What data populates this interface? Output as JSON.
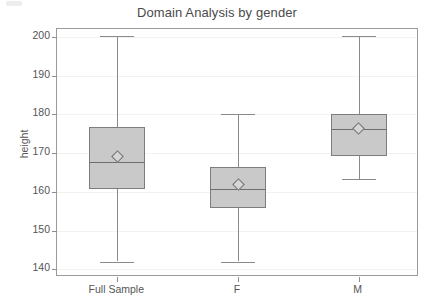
{
  "chart_data": {
    "type": "box",
    "title": "Domain Analysis by gender",
    "xlabel": "",
    "ylabel": "height",
    "categories": [
      "Full Sample",
      "F",
      "M"
    ],
    "ylim": [
      138,
      202
    ],
    "yticks": [
      140,
      150,
      160,
      170,
      180,
      190,
      200
    ],
    "ytick_labels": [
      "140",
      "150",
      "160",
      "170",
      "180",
      "190",
      "200"
    ],
    "grid": true,
    "legend": "none",
    "marker": "mean-diamond",
    "boxes": [
      {
        "category": "Full Sample",
        "whisker_low": 142.0,
        "q1": 160.8,
        "median": 167.6,
        "q3": 176.6,
        "whisker_high": 200.1,
        "mean": 169.0
      },
      {
        "category": "F",
        "whisker_low": 142.0,
        "q1": 155.7,
        "median": 160.8,
        "q3": 166.3,
        "whisker_high": 180.1,
        "mean": 161.8
      },
      {
        "category": "M",
        "whisker_low": 163.3,
        "q1": 169.2,
        "median": 176.2,
        "q3": 180.1,
        "whisker_high": 200.3,
        "mean": 176.4
      }
    ],
    "colors": {
      "box_fill": "#c9c9c9",
      "box_border": "#7d7d7d",
      "whisker": "#8a8a8a",
      "median": "#6e6e6e",
      "frame": "#9a9a9a",
      "grid": "#f2f2f2",
      "text": "#555555",
      "background": "#ffffff"
    }
  }
}
